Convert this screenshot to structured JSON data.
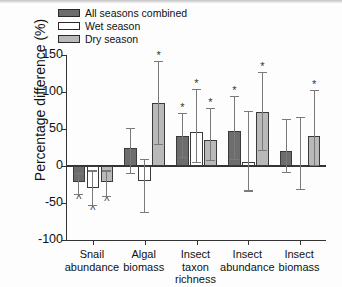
{
  "chart_data": {
    "type": "bar",
    "title": "",
    "xlabel": "",
    "ylabel": "Percentage difference (%)",
    "ylim": [
      -100,
      150
    ],
    "yticks": [
      -100,
      -50,
      0,
      50,
      100,
      150
    ],
    "ytick_labels": [
      "-100",
      "-50",
      "0",
      "50",
      "100",
      "150"
    ],
    "grid": false,
    "legend_position": "top-left",
    "categories": [
      "Snail abundance",
      "Algal biomass",
      "Insect taxon richness",
      "Insect abundance",
      "Insect biomass"
    ],
    "category_lines": [
      [
        "Snail",
        "abundance"
      ],
      [
        "Algal",
        "biomass"
      ],
      [
        "Insect",
        "taxon richness"
      ],
      [
        "Insect",
        "abundance"
      ],
      [
        "Insect",
        "biomass"
      ]
    ],
    "series": [
      {
        "name": "All seasons combined",
        "color": "#6d6d6d",
        "values": [
          -22,
          25,
          41,
          47,
          20
        ],
        "err_low": [
          -38,
          -10,
          12,
          9,
          -8
        ],
        "err_high": [
          -9,
          52,
          72,
          95,
          64
        ],
        "significance": [
          "^",
          "",
          "*",
          "*",
          ""
        ]
      },
      {
        "name": "Wet season",
        "color": "#ffffff",
        "values": [
          -30,
          -20,
          46,
          5,
          2
        ],
        "err_low": [
          -53,
          -62,
          6,
          -33,
          -31
        ],
        "err_high": [
          -6,
          10,
          104,
          74,
          66
        ],
        "significance": [
          "^",
          "",
          "*",
          "",
          ""
        ]
      },
      {
        "name": "Dry season",
        "color": "#b9b9b9",
        "values": [
          -22,
          85,
          35,
          73,
          40
        ],
        "err_low": [
          -40,
          30,
          8,
          22,
          1
        ],
        "err_high": [
          -6,
          142,
          78,
          127,
          103
        ],
        "significance": [
          "^",
          "*",
          "*",
          "*",
          "*"
        ]
      }
    ]
  },
  "legend": {
    "items": [
      {
        "label": "All seasons combined",
        "swatch": "sw-all"
      },
      {
        "label": "Wet season",
        "swatch": "sw-wet"
      },
      {
        "label": "Dry season",
        "swatch": "sw-dry"
      }
    ]
  },
  "axis": {
    "y_title": "Percentage difference (%)"
  }
}
